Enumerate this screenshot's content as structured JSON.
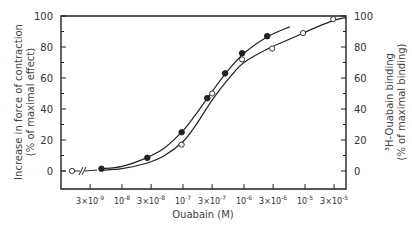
{
  "chart_data": {
    "type": "scatter",
    "title": "",
    "xlabel": "Ouabain (M)",
    "ylabel_left": [
      "Increase in force of contraction",
      "(% of maximal effect)"
    ],
    "ylabel_right": [
      "³H-Ouabain binding",
      "(% of maximal binding)"
    ],
    "x_scale": "log",
    "x_axis_break": true,
    "xlim_log10": [
      -9.02,
      -4.33
    ],
    "ylim": [
      -19,
      100
    ],
    "yticks": [
      0,
      20,
      40,
      60,
      80,
      100
    ],
    "xticks": [
      {
        "value": 3e-09,
        "base": "3×10",
        "exp": "-9"
      },
      {
        "value": 1e-08,
        "base": "10",
        "exp": "-8"
      },
      {
        "value": 3e-08,
        "base": "3×10",
        "exp": "-8"
      },
      {
        "value": 1e-07,
        "base": "10",
        "exp": "-7"
      },
      {
        "value": 3e-07,
        "base": "3×10",
        "exp": "-7"
      },
      {
        "value": 1e-06,
        "base": "10",
        "exp": "-6"
      },
      {
        "value": 3e-06,
        "base": "3×10",
        "exp": "-6"
      },
      {
        "value": 1e-05,
        "base": "10",
        "exp": "-5"
      },
      {
        "value": 3e-05,
        "base": "3×10",
        "exp": "-5"
      }
    ],
    "grid": false,
    "series": [
      {
        "name": "Increase in force of contraction",
        "marker": "filled-circle",
        "axis": "left",
        "points": [
          {
            "x": 4.6e-09,
            "y": 1.5
          },
          {
            "x": 2.6e-08,
            "y": 8.5
          },
          {
            "x": 9.5e-08,
            "y": 25
          },
          {
            "x": 2.5e-07,
            "y": 47
          },
          {
            "x": 4.9e-07,
            "y": 63
          },
          {
            "x": 9.3e-07,
            "y": 76
          },
          {
            "x": 2.4e-06,
            "y": 87
          }
        ],
        "curve": [
          [
            -8.34,
            1.5
          ],
          [
            -8.0,
            3
          ],
          [
            -7.6,
            8.5
          ],
          [
            -7.3,
            15
          ],
          [
            -7.0,
            26
          ],
          [
            -6.8,
            36
          ],
          [
            -6.6,
            47
          ],
          [
            -6.3,
            63
          ],
          [
            -6.0,
            76
          ],
          [
            -5.6,
            87
          ],
          [
            -5.25,
            93
          ]
        ]
      },
      {
        "name": "³H-Ouabain binding",
        "marker": "open-circle",
        "axis": "right",
        "control_point": {
          "label": "control",
          "y": 0
        },
        "points": [
          {
            "x": 9.5e-08,
            "y": 17
          },
          {
            "x": 3e-07,
            "y": 50
          },
          {
            "x": 9.3e-07,
            "y": 72
          },
          {
            "x": 2.9e-06,
            "y": 79
          },
          {
            "x": 9.3e-06,
            "y": 89
          },
          {
            "x": 2.9e-05,
            "y": 98
          }
        ],
        "curve": [
          [
            -8.34,
            0.5
          ],
          [
            -8.0,
            1.5
          ],
          [
            -7.6,
            5
          ],
          [
            -7.3,
            10
          ],
          [
            -7.0,
            19
          ],
          [
            -6.8,
            29
          ],
          [
            -6.5,
            47
          ],
          [
            -6.2,
            62
          ],
          [
            -6.0,
            70
          ],
          [
            -5.6,
            79
          ],
          [
            -5.2,
            86
          ],
          [
            -4.8,
            93
          ],
          [
            -4.5,
            97.5
          ],
          [
            -4.33,
            99
          ]
        ]
      }
    ]
  }
}
